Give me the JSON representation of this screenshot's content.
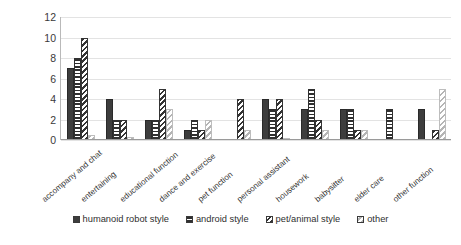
{
  "chart_data": {
    "type": "bar",
    "title": "",
    "subtitle": "",
    "xlabel": "",
    "ylabel": "",
    "ylim": [
      0,
      12
    ],
    "yticks": [
      0,
      2,
      4,
      6,
      8,
      10,
      12
    ],
    "grid": true,
    "legend_position": "bottom",
    "orientation": "vertical",
    "grouping": "grouped",
    "categories": [
      "accompany and chat",
      "entertaining",
      "educational function",
      "dance and exercise",
      "pet function",
      "personal assistant",
      "housework",
      "babysitter",
      "elder care",
      "other function"
    ],
    "series": [
      {
        "name": "humanoid robot style",
        "pattern": "solid-dark",
        "color": "#3d3d3d",
        "values": [
          7,
          4,
          2,
          1,
          0,
          4,
          3,
          3,
          0,
          3
        ]
      },
      {
        "name": "android style",
        "pattern": "horizontal-stripes",
        "color": "#303030",
        "values": [
          8,
          2,
          2,
          2,
          0,
          3,
          5,
          3,
          3,
          0
        ]
      },
      {
        "name": "pet/animal style",
        "pattern": "diagonal-hatch-dark",
        "color": "#343434",
        "values": [
          10,
          2,
          5,
          1,
          4,
          4,
          2,
          1,
          0,
          1
        ]
      },
      {
        "name": "other",
        "pattern": "diagonal-hatch-light",
        "color": "#b5b5b5",
        "values": [
          0.5,
          0.3,
          3,
          2,
          1,
          0.2,
          1,
          1,
          0,
          5
        ]
      }
    ]
  }
}
